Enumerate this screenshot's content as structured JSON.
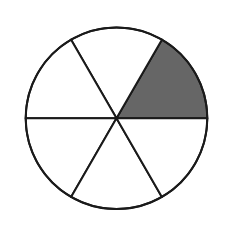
{
  "diagram": {
    "type": "fraction-circle",
    "total_sectors": 6,
    "shaded_sectors": 1,
    "shaded_sector_position": "upper-right (0° to 60°)",
    "fraction_shaded": "1/6",
    "colors": {
      "background": "#ffffff",
      "stroke": "#1a1a1a",
      "shaded_fill": "#666666",
      "unshaded_fill": "#ffffff"
    }
  }
}
